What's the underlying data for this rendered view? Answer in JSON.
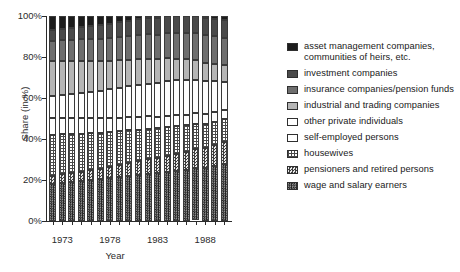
{
  "chart_data": {
    "type": "bar",
    "subtype": "stacked-percentage",
    "title": "",
    "xlabel": "Year",
    "ylabel": "Share (in %)",
    "ylim": [
      0,
      100
    ],
    "ytick_labels": [
      "0%",
      "20%",
      "40%",
      "60%",
      "80%",
      "100%"
    ],
    "ytick_values": [
      0,
      20,
      40,
      60,
      80,
      100
    ],
    "grid": false,
    "legend_position": "right",
    "categories": [
      1972,
      1973,
      1974,
      1975,
      1976,
      1977,
      1978,
      1979,
      1980,
      1981,
      1982,
      1983,
      1984,
      1985,
      1986,
      1987,
      1988,
      1989,
      1990
    ],
    "xtick_labels": [
      "1973",
      "1978",
      "1983",
      "1988"
    ],
    "xtick_label_years": [
      1973,
      1978,
      1983,
      1988
    ],
    "series": [
      {
        "name": "wage and salary earners",
        "pattern": "dense-dark-hatch",
        "color": "#2b2b2b",
        "values": [
          18.0,
          18.5,
          19.0,
          19.5,
          20.0,
          20.5,
          21.0,
          21.5,
          22.0,
          22.5,
          23.0,
          23.5,
          24.0,
          24.5,
          25.0,
          25.5,
          26.0,
          27.0,
          28.0
        ]
      },
      {
        "name": "pensioners and retired persons",
        "pattern": "checkerboard",
        "color": "#8a8a8a",
        "values": [
          4.0,
          4.2,
          4.4,
          4.6,
          4.8,
          5.0,
          5.4,
          5.8,
          6.2,
          6.6,
          7.0,
          7.4,
          7.8,
          8.2,
          8.6,
          9.0,
          9.5,
          10.0,
          10.5
        ]
      },
      {
        "name": "housewives",
        "pattern": "sparse-dots",
        "color": "#d8d8d8",
        "values": [
          20.0,
          19.5,
          19.0,
          18.5,
          18.0,
          17.5,
          17.0,
          16.5,
          16.0,
          15.5,
          15.0,
          14.5,
          14.0,
          13.5,
          13.0,
          12.5,
          12.0,
          11.5,
          11.0
        ]
      },
      {
        "name": "self-employed persons",
        "pattern": "solid-white",
        "color": "#ffffff",
        "values": [
          8.0,
          7.8,
          7.6,
          7.4,
          7.2,
          7.0,
          6.8,
          6.6,
          6.4,
          6.2,
          6.0,
          5.8,
          5.6,
          5.4,
          5.2,
          5.0,
          4.8,
          4.6,
          4.4
        ]
      },
      {
        "name": "other private individuals",
        "pattern": "solid-white",
        "color": "#ffffff",
        "values": [
          11.0,
          11.5,
          12.0,
          12.5,
          13.0,
          13.5,
          14.0,
          14.5,
          15.0,
          15.5,
          16.0,
          16.5,
          17.0,
          17.0,
          17.0,
          16.5,
          16.0,
          15.0,
          14.0
        ]
      },
      {
        "name": "industrial and trading companies",
        "pattern": "solid-light-gray",
        "color": "#b5b5b5",
        "values": [
          17.0,
          16.5,
          16.0,
          15.5,
          15.0,
          14.5,
          14.0,
          13.5,
          13.0,
          12.5,
          12.0,
          11.5,
          11.0,
          10.5,
          10.0,
          9.5,
          9.0,
          8.5,
          8.0
        ]
      },
      {
        "name": "insurance companies/pension funds",
        "pattern": "solid-dark-gray",
        "color": "#6e6e6e",
        "values": [
          10.0,
          10.2,
          10.4,
          10.6,
          10.8,
          11.0,
          11.2,
          11.4,
          11.6,
          11.8,
          12.0,
          12.2,
          12.4,
          12.6,
          12.8,
          13.0,
          13.2,
          13.4,
          13.6
        ]
      },
      {
        "name": "investment companies",
        "pattern": "solid-darker-gray",
        "color": "#4a4a4a",
        "values": [
          5.0,
          5.3,
          5.6,
          5.9,
          6.2,
          6.5,
          6.8,
          7.1,
          7.4,
          7.7,
          8.0,
          8.1,
          8.2,
          8.3,
          8.4,
          8.5,
          8.5,
          8.5,
          8.5
        ]
      },
      {
        "name": "asset management companies, communities of heirs, etc.",
        "pattern": "solid-black",
        "color": "#1c1c1c",
        "values": [
          7.0,
          6.5,
          6.0,
          5.5,
          5.0,
          4.5,
          3.8,
          3.1,
          2.4,
          1.7,
          1.0,
          0.5,
          0.0,
          0.0,
          0.0,
          0.0,
          1.0,
          1.5,
          2.0
        ]
      }
    ]
  },
  "legend": {
    "items": [
      {
        "label": "asset management companies,",
        "label2": "communities of heirs, etc.",
        "swatch": "solid-black"
      },
      {
        "label": "investment companies",
        "label2": "",
        "swatch": "solid-darker-gray"
      },
      {
        "label": "insurance companies/pension funds",
        "label2": "",
        "swatch": "solid-dark-gray"
      },
      {
        "label": "industrial and trading companies",
        "label2": "",
        "swatch": "solid-light-gray"
      },
      {
        "label": "other private individuals",
        "label2": "",
        "swatch": "solid-white"
      },
      {
        "label": "self-employed persons",
        "label2": "",
        "swatch": "solid-white"
      },
      {
        "label": "housewives",
        "label2": "",
        "swatch": "sparse-dots"
      },
      {
        "label": "pensioners and retired persons",
        "label2": "",
        "swatch": "checkerboard"
      },
      {
        "label": "wage and salary earners",
        "label2": "",
        "swatch": "dense-dark-hatch"
      }
    ]
  }
}
